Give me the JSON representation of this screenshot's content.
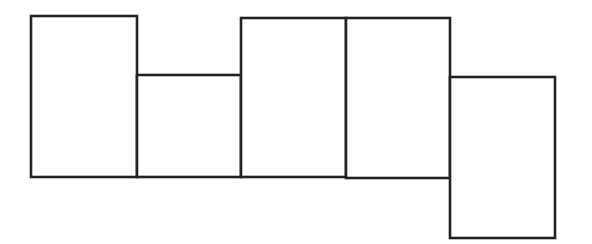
{
  "diagram": {
    "type": "net",
    "stroke_color": "#222222",
    "background": "#ffffff",
    "faces": [
      {
        "id": "face-1",
        "x": 31,
        "y": 16,
        "w": 106,
        "h": 161
      },
      {
        "id": "face-2",
        "x": 137,
        "y": 75,
        "w": 104,
        "h": 102
      },
      {
        "id": "face-3",
        "x": 241,
        "y": 18,
        "w": 105,
        "h": 159
      },
      {
        "id": "face-4",
        "x": 346,
        "y": 18,
        "w": 104,
        "h": 160
      },
      {
        "id": "face-5",
        "x": 450,
        "y": 77,
        "w": 105,
        "h": 161
      }
    ]
  }
}
